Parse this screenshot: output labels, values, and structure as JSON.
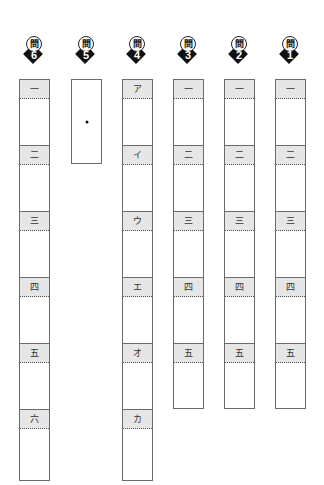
{
  "sheet": {
    "badge_prefix": "問",
    "columns": [
      {
        "question": "6",
        "labels": [
          "一",
          "二",
          "三",
          "四",
          "五",
          "六"
        ]
      },
      {
        "question": "5",
        "labels": [],
        "mark": "・"
      },
      {
        "question": "4",
        "labels": [
          "ア",
          "イ",
          "ウ",
          "エ",
          "オ",
          "カ"
        ]
      },
      {
        "question": "3",
        "labels": [
          "一",
          "二",
          "三",
          "四",
          "五"
        ]
      },
      {
        "question": "2",
        "labels": [
          "一",
          "二",
          "三",
          "四",
          "五"
        ]
      },
      {
        "question": "1",
        "labels": [
          "一",
          "二",
          "三",
          "四",
          "五"
        ]
      }
    ]
  },
  "colors": {
    "border": "#6b6b6b",
    "header_fill": "#e6e6e6",
    "badge": "#111111"
  }
}
